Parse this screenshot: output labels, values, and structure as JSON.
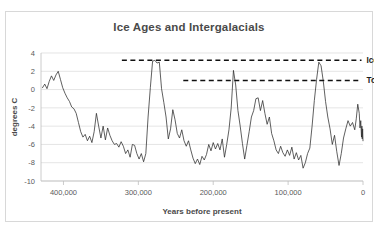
{
  "chart_data": {
    "type": "line",
    "title": "Ice Ages and Intergalacials",
    "xlabel": "Years before present",
    "ylabel": "degrees C",
    "xlim": [
      430000,
      0
    ],
    "ylim": [
      -10,
      4
    ],
    "x_reversed": true,
    "grid": true,
    "legend": "none",
    "x_ticks": [
      "400,000",
      "300,000",
      "200,000",
      "100,000",
      "0"
    ],
    "x_tick_values": [
      400000,
      300000,
      200000,
      100000,
      0
    ],
    "y_ticks": [
      "4",
      "2",
      "0",
      "-2",
      "-4",
      "-6",
      "-8",
      "-10"
    ],
    "y_tick_values": [
      4,
      2,
      0,
      -2,
      -4,
      -6,
      -8,
      -10
    ],
    "series_name": "Temperature anomaly",
    "series_color": "#2b2b2b",
    "annotations": [
      {
        "label": "Ice Age Highs",
        "value": 3.2,
        "x_start": 322000,
        "x_end": 2000,
        "style": "dashed"
      },
      {
        "label": "Today",
        "value": 1.0,
        "x_start": 240000,
        "x_end": 2000,
        "style": "dashed"
      }
    ],
    "x": [
      428000,
      425000,
      422000,
      419000,
      416000,
      413000,
      410000,
      407000,
      404000,
      401000,
      398000,
      395000,
      392000,
      389000,
      386000,
      383000,
      380000,
      377000,
      374000,
      371000,
      368000,
      365000,
      362000,
      359000,
      356000,
      353000,
      350000,
      347000,
      344000,
      341000,
      338000,
      335000,
      332000,
      329000,
      326000,
      323000,
      320000,
      317000,
      314000,
      311000,
      308000,
      305000,
      302000,
      299000,
      296000,
      293000,
      290000,
      287000,
      284000,
      281000,
      278000,
      275000,
      272000,
      269000,
      266000,
      263000,
      260000,
      257000,
      254000,
      251000,
      248000,
      245000,
      242000,
      239000,
      236000,
      233000,
      230000,
      227000,
      224000,
      221000,
      218000,
      215000,
      212000,
      209000,
      206000,
      203000,
      200000,
      197000,
      194000,
      191000,
      188000,
      185000,
      182000,
      179000,
      176000,
      173000,
      170000,
      167000,
      164000,
      161000,
      158000,
      155000,
      152000,
      149000,
      146000,
      143000,
      140000,
      137000,
      134000,
      131000,
      128000,
      125000,
      122000,
      119000,
      116000,
      113000,
      110000,
      107000,
      104000,
      101000,
      98000,
      95000,
      92000,
      89000,
      86000,
      83000,
      80000,
      77000,
      74000,
      71000,
      68000,
      65000,
      62000,
      59000,
      56000,
      53000,
      50000,
      47000,
      44000,
      41000,
      38000,
      35000,
      32000,
      29000,
      26000,
      23000,
      20000,
      17000,
      14000,
      11000,
      9000,
      7000,
      5000,
      4000,
      3000,
      2000,
      1500,
      1000,
      500,
      0
    ],
    "y": [
      0.2,
      0.6,
      0.1,
      0.9,
      1.5,
      1.0,
      1.6,
      2.0,
      1.1,
      0.2,
      -0.4,
      -0.9,
      -1.3,
      -1.9,
      -2.1,
      -2.6,
      -3.6,
      -4.6,
      -5.2,
      -4.9,
      -5.6,
      -5.1,
      -5.8,
      -4.6,
      -2.6,
      -4.0,
      -5.3,
      -4.0,
      -5.5,
      -4.2,
      -5.0,
      -5.6,
      -6.0,
      -5.9,
      -6.3,
      -5.7,
      -6.2,
      -7.0,
      -6.6,
      -7.4,
      -6.0,
      -6.1,
      -7.0,
      -7.6,
      -7.0,
      -7.9,
      -7.0,
      -3.0,
      0.2,
      3.1,
      3.2,
      2.9,
      3.0,
      0.1,
      -1.4,
      -3.0,
      -5.4,
      -4.3,
      -2.2,
      -3.3,
      -4.8,
      -5.3,
      -4.4,
      -5.6,
      -6.2,
      -5.6,
      -6.6,
      -7.5,
      -8.1,
      -7.6,
      -8.2,
      -7.3,
      -7.7,
      -7.1,
      -6.0,
      -6.7,
      -5.8,
      -6.5,
      -5.9,
      -6.6,
      -5.4,
      -7.4,
      -6.0,
      -4.4,
      -2.0,
      2.1,
      0.5,
      -2.3,
      -4.0,
      -5.9,
      -7.6,
      -6.1,
      -4.6,
      -3.0,
      -2.3,
      -1.0,
      -0.9,
      -2.3,
      -1.2,
      -2.6,
      -3.8,
      -3.0,
      -4.8,
      -5.6,
      -6.6,
      -7.0,
      -6.2,
      -6.9,
      -7.3,
      -6.6,
      -7.2,
      -6.3,
      -7.6,
      -6.9,
      -7.7,
      -7.2,
      -8.6,
      -8.0,
      -7.0,
      -6.4,
      -4.0,
      -1.2,
      1.1,
      3.0,
      2.6,
      0.9,
      -1.3,
      -3.0,
      -4.3,
      -6.0,
      -5.0,
      -6.8,
      -8.3,
      -7.0,
      -5.3,
      -4.3,
      -3.4,
      -4.0,
      -3.6,
      -4.4,
      -3.2,
      -1.6,
      -2.6,
      -4.2,
      -3.4,
      -5.2,
      -4.0,
      -5.4,
      -4.3,
      -5.6,
      -6.4,
      -5.3,
      -6.4,
      -5.0,
      -6.2,
      -7.0,
      -6.2,
      -7.4,
      -8.0,
      -7.2,
      -8.3,
      -8.9,
      -8.1,
      -7.6,
      -6.0,
      -4.2,
      -2.4,
      -1.6,
      -0.4,
      0.4,
      -0.8,
      0.6,
      -0.3,
      0.9,
      0.2,
      1.0
    ]
  }
}
